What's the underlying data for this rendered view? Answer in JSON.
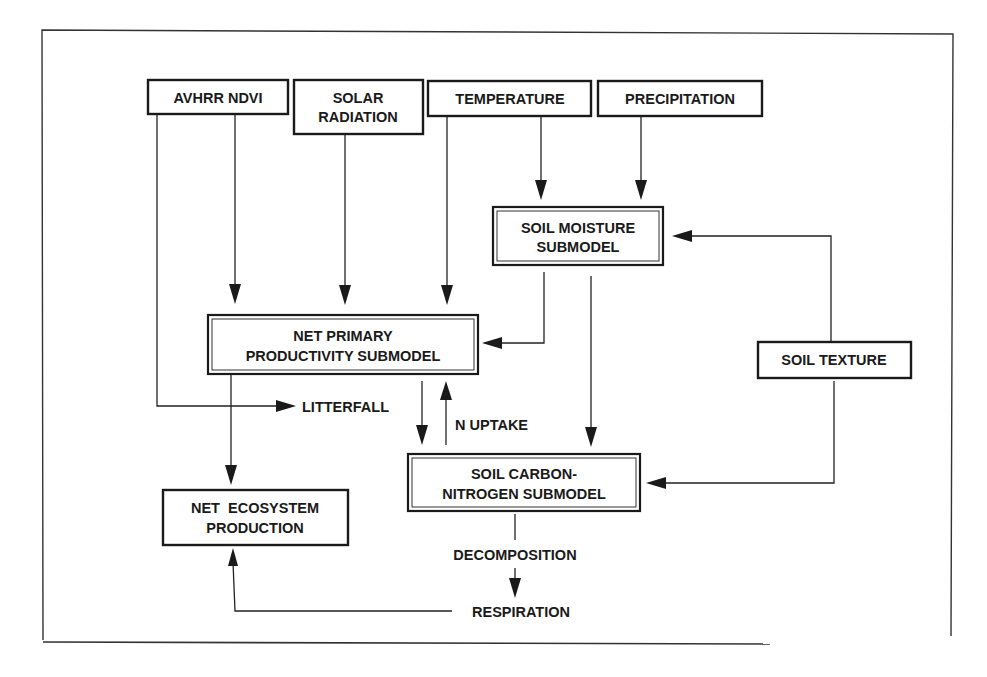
{
  "diagram": {
    "type": "flow-diagram",
    "inputs": {
      "avhrr_ndvi": "AVHRR NDVI",
      "solar_radiation": [
        "SOLAR",
        "RADIATION"
      ],
      "temperature": "TEMPERATURE",
      "precipitation": "PRECIPITATION",
      "soil_texture": "SOIL TEXTURE"
    },
    "submodels": {
      "soil_moisture": [
        "SOIL MOISTURE",
        "SUBMODEL"
      ],
      "npp": [
        "NET PRIMARY",
        "PRODUCTIVITY SUBMODEL"
      ],
      "soil_cn": [
        "SOIL CARBON-",
        "NITROGEN SUBMODEL"
      ]
    },
    "outputs": {
      "nep": [
        "NET  ECOSYSTEM",
        "PRODUCTION"
      ]
    },
    "flow_labels": {
      "litterfall": "LITTERFALL",
      "n_uptake": "N UPTAKE",
      "decomposition": "DECOMPOSITION",
      "respiration": "RESPIRATION"
    },
    "edges": [
      {
        "from": "AVHRR NDVI",
        "to": "NET PRIMARY PRODUCTIVITY SUBMODEL"
      },
      {
        "from": "AVHRR NDVI",
        "to": "LITTERFALL"
      },
      {
        "from": "SOLAR RADIATION",
        "to": "NET PRIMARY PRODUCTIVITY SUBMODEL"
      },
      {
        "from": "TEMPERATURE",
        "to": "NET PRIMARY PRODUCTIVITY SUBMODEL"
      },
      {
        "from": "TEMPERATURE",
        "to": "SOIL MOISTURE SUBMODEL"
      },
      {
        "from": "PRECIPITATION",
        "to": "SOIL MOISTURE SUBMODEL"
      },
      {
        "from": "SOIL TEXTURE",
        "to": "SOIL MOISTURE SUBMODEL"
      },
      {
        "from": "SOIL TEXTURE",
        "to": "SOIL CARBON-NITROGEN SUBMODEL"
      },
      {
        "from": "SOIL MOISTURE SUBMODEL",
        "to": "NET PRIMARY PRODUCTIVITY SUBMODEL"
      },
      {
        "from": "SOIL MOISTURE SUBMODEL",
        "to": "SOIL CARBON-NITROGEN SUBMODEL"
      },
      {
        "from": "NET PRIMARY PRODUCTIVITY SUBMODEL",
        "to": "SOIL CARBON-NITROGEN SUBMODEL"
      },
      {
        "from": "SOIL CARBON-NITROGEN SUBMODEL",
        "to": "NET PRIMARY PRODUCTIVITY SUBMODEL",
        "label": "N UPTAKE"
      },
      {
        "from": "NET PRIMARY PRODUCTIVITY SUBMODEL",
        "to": "NET ECOSYSTEM PRODUCTION"
      },
      {
        "from": "SOIL CARBON-NITROGEN SUBMODEL",
        "to": "RESPIRATION",
        "label": "DECOMPOSITION"
      },
      {
        "from": "RESPIRATION",
        "to": "NET ECOSYSTEM PRODUCTION"
      }
    ]
  }
}
